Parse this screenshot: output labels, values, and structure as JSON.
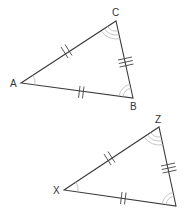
{
  "diagram": {
    "type": "congruent-triangles",
    "colors": {
      "line": "#3a3a3a",
      "arc": "#b8b8b8",
      "label": "#333333",
      "background": "#ffffff"
    },
    "triangles": [
      {
        "name": "ABC",
        "vertices": {
          "A": {
            "label": "A",
            "x": 21,
            "y": 83
          },
          "B": {
            "label": "B",
            "x": 133,
            "y": 98
          },
          "C": {
            "label": "C",
            "x": 116,
            "y": 21
          }
        },
        "side_marks": {
          "AC": "crossed-double-tick",
          "CB": "triple-tick",
          "AB": "double-tick"
        },
        "angle_marks": {
          "A": "single-arc",
          "B": "double-arc",
          "C": "triple-arc"
        }
      },
      {
        "name": "XYZ",
        "vertices": {
          "X": {
            "label": "X",
            "x": 64,
            "y": 190
          },
          "Y": {
            "label": "",
            "x": 176,
            "y": 206
          },
          "Z": {
            "label": "Z",
            "x": 159,
            "y": 127
          }
        },
        "side_marks": {
          "XZ": "crossed-double-tick",
          "ZY": "triple-tick",
          "XY": "double-tick"
        },
        "angle_marks": {
          "X": "single-arc",
          "Y": "double-arc",
          "Z": "triple-arc"
        }
      }
    ]
  },
  "labels": {
    "A": "A",
    "B": "B",
    "C": "C",
    "X": "X",
    "Z": "Z"
  }
}
